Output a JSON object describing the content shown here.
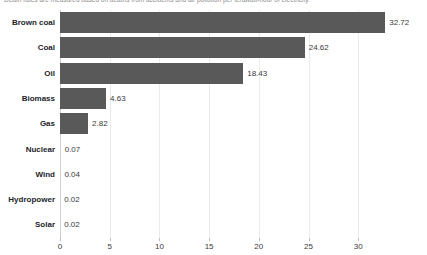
{
  "chart_data": {
    "type": "bar",
    "orientation": "horizontal",
    "title": "",
    "subtitle": "Death rates are measured based on deaths from accidents and air pollution per terawatt-hour of electricity.",
    "xlabel": "",
    "ylabel": "",
    "categories": [
      "Brown coal",
      "Coal",
      "Oil",
      "Biomass",
      "Gas",
      "Nuclear",
      "Wind",
      "Hydropower",
      "Solar"
    ],
    "values": [
      32.72,
      24.62,
      18.43,
      4.63,
      2.82,
      0.07,
      0.04,
      0.02,
      0.02
    ],
    "value_labels": [
      "32.72",
      "24.62",
      "18.43",
      "4.63",
      "2.82",
      "0.07",
      "0.04",
      "0.02",
      "0.02"
    ],
    "xticks": [
      0,
      5,
      10,
      15,
      20,
      25,
      30
    ],
    "xtick_labels": [
      "0",
      "5",
      "10",
      "15",
      "20",
      "25",
      "30"
    ],
    "xlim": [
      0,
      33.5
    ],
    "grid": "vertical",
    "legend": "none",
    "bar_color": "#595959",
    "grid_color": "#ebebeb",
    "axis_color": "#d0d0d0",
    "label_color": "#22242a",
    "value_color": "#3a3a3a"
  }
}
